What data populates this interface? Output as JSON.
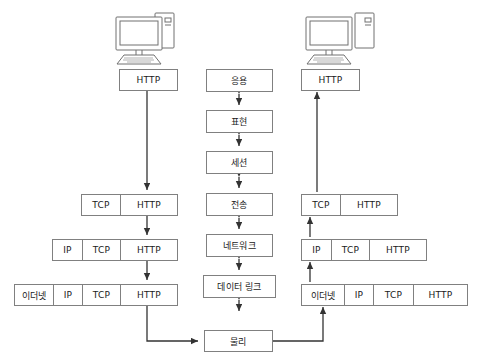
{
  "diagram": {
    "colors": {
      "stroke": "#808080",
      "arrow": "#333333",
      "text": "#1a1a1a",
      "background": "#ffffff"
    }
  },
  "sender": {
    "computer_label": "sender-computer",
    "http_box": {
      "cells": [
        {
          "label": "HTTP",
          "width": 57
        }
      ]
    },
    "transport_box": {
      "cells": [
        {
          "label": "TCP",
          "width": 38
        },
        {
          "label": "HTTP",
          "width": 57
        }
      ]
    },
    "network_box": {
      "cells": [
        {
          "label": "IP",
          "width": 29
        },
        {
          "label": "TCP",
          "width": 38
        },
        {
          "label": "HTTP",
          "width": 57
        }
      ]
    },
    "link_box": {
      "cells": [
        {
          "label": "이더넷",
          "width": 38
        },
        {
          "label": "IP",
          "width": 29
        },
        {
          "label": "TCP",
          "width": 38
        },
        {
          "label": "HTTP",
          "width": 57
        }
      ]
    }
  },
  "receiver": {
    "computer_label": "receiver-computer",
    "http_box": {
      "cells": [
        {
          "label": "HTTP",
          "width": 57
        }
      ]
    },
    "transport_box": {
      "cells": [
        {
          "label": "TCP",
          "width": 38
        },
        {
          "label": "HTTP",
          "width": 57
        }
      ]
    },
    "network_box": {
      "cells": [
        {
          "label": "IP",
          "width": 29
        },
        {
          "label": "TCP",
          "width": 38
        },
        {
          "label": "HTTP",
          "width": 57
        }
      ]
    },
    "link_box": {
      "cells": [
        {
          "label": "이더넷",
          "width": 42
        },
        {
          "label": "IP",
          "width": 29
        },
        {
          "label": "TCP",
          "width": 40
        },
        {
          "label": "HTTP",
          "width": 54
        }
      ]
    }
  },
  "osi_stack": {
    "layers": [
      {
        "label": "응용"
      },
      {
        "label": "표현"
      },
      {
        "label": "세션"
      },
      {
        "label": "전송"
      },
      {
        "label": "네트워크"
      },
      {
        "label": "데이터 링크"
      },
      {
        "label": "물리"
      }
    ]
  }
}
